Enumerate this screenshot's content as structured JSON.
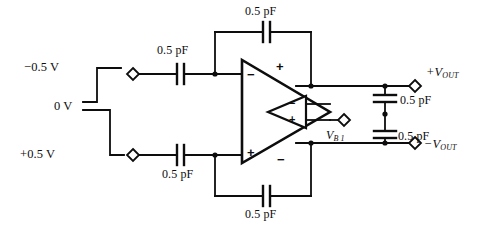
{
  "diagram": {
    "stroke_color": "#0d0d0d",
    "background_color": "#ffffff"
  },
  "input_waveform": {
    "levels": [
      {
        "id": "neg",
        "label": "−0.5 V"
      },
      {
        "id": "zero",
        "label": "0 V"
      },
      {
        "id": "pos",
        "label": "+0.5 V"
      }
    ]
  },
  "capacitors": {
    "input_top": {
      "label": "0.5 pF"
    },
    "input_bottom": {
      "label": "0.5 pF"
    },
    "feedback_top": {
      "label": "0.5 pF"
    },
    "feedback_bottom": {
      "label": "0.5 pF"
    },
    "load_top": {
      "label": "0.5 pF"
    },
    "load_bottom": {
      "label": "0.5 pF"
    }
  },
  "amplifier": {
    "outer": {
      "minus_top": "−",
      "plus_top": "+",
      "plus_bottom": "+",
      "minus_bottom": "−"
    },
    "inner": {
      "minus": "−",
      "plus": "+"
    }
  },
  "terminals": {
    "input_top": {
      "name": "input-top-terminal"
    },
    "input_bottom": {
      "name": "input-bottom-terminal"
    },
    "bias": {
      "label_main": "V",
      "label_sub": "B 1"
    },
    "output_pos": {
      "label_main": "+V",
      "label_sub": "OUT"
    },
    "output_neg": {
      "label_main": "−V",
      "label_sub": "OUT"
    }
  }
}
